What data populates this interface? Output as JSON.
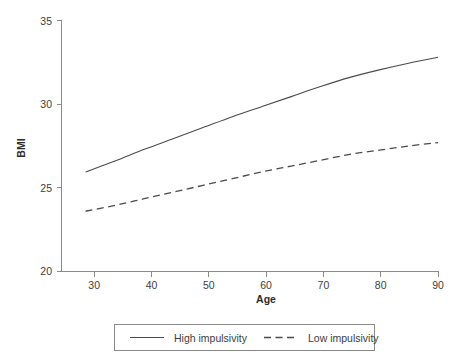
{
  "chart_data": {
    "type": "line",
    "title": "",
    "xlabel": "Age",
    "ylabel": "BMI",
    "xlim": [
      25.9,
      90
    ],
    "ylim": [
      20,
      35
    ],
    "xticks": [
      30,
      40,
      50,
      60,
      70,
      80,
      90
    ],
    "xtick_labels": [
      "30",
      "40",
      "50",
      "60",
      "70",
      "80",
      "90"
    ],
    "yticks": [
      20,
      25,
      30,
      35
    ],
    "ytick_labels": [
      "20",
      "25",
      "30",
      "35"
    ],
    "grid": false,
    "legend_position": "below-center",
    "x": [
      30,
      35,
      40,
      45,
      50,
      55,
      60,
      65,
      70,
      75,
      80,
      85,
      90
    ],
    "series": [
      {
        "name": "High impulsivity",
        "style": "solid",
        "color": "#4a4a4a",
        "values": [
          25.95,
          26.6,
          27.3,
          27.95,
          28.6,
          29.25,
          29.85,
          30.45,
          31.05,
          31.6,
          32.05,
          32.45,
          32.8
        ]
      },
      {
        "name": "Low impulsivity",
        "style": "dashed",
        "color": "#4a4a4a",
        "values": [
          23.6,
          23.95,
          24.35,
          24.75,
          25.15,
          25.55,
          25.95,
          26.3,
          26.65,
          27.0,
          27.25,
          27.5,
          27.7
        ]
      }
    ]
  },
  "axes": {
    "y_title": "BMI",
    "x_title": "Age",
    "y_tick_labels": [
      "35",
      "30",
      "25",
      "20"
    ],
    "x_tick_labels": [
      "30",
      "40",
      "50",
      "60",
      "70",
      "80",
      "90"
    ]
  },
  "legend": {
    "entries": [
      {
        "label": "High impulsivity",
        "style": "solid"
      },
      {
        "label": "Low impulsivity",
        "style": "dashed"
      }
    ]
  }
}
